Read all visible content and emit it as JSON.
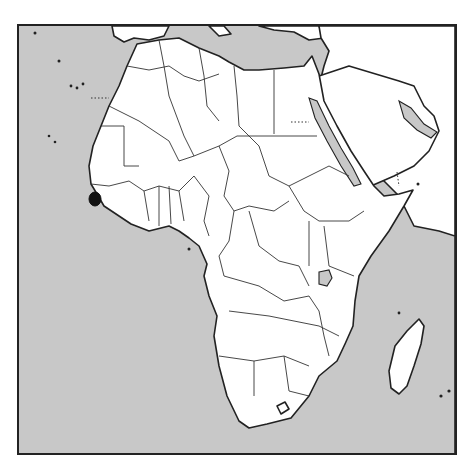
{
  "map": {
    "region": "Africa",
    "highlighted_country": "Sierra Leone",
    "colors": {
      "ocean": "#c8c8c8",
      "land": "#ffffff",
      "borders": "#333333",
      "highlight": "#111111",
      "frame": "#222222"
    }
  }
}
